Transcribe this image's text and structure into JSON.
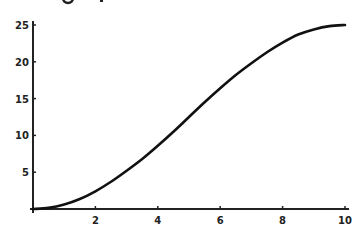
{
  "chart_data": {
    "type": "line",
    "title": "",
    "xlabel": "",
    "ylabel": "",
    "xlim": [
      0,
      10
    ],
    "ylim": [
      0,
      25
    ],
    "grid": false,
    "legend": null,
    "x_ticks": [
      2,
      4,
      6,
      8,
      10
    ],
    "y_ticks": [
      5,
      10,
      15,
      20,
      25
    ],
    "series": [
      {
        "name": "curve",
        "color": "#111111",
        "x": [
          0,
          0.5,
          1,
          1.5,
          2,
          2.5,
          3,
          3.5,
          4,
          4.5,
          5,
          5.5,
          6,
          6.5,
          7,
          7.5,
          8,
          8.5,
          9,
          9.5,
          10
        ],
        "y": [
          0,
          0.15,
          0.6,
          1.35,
          2.4,
          3.7,
          5.2,
          6.8,
          8.6,
          10.5,
          12.5,
          14.5,
          16.4,
          18.2,
          19.8,
          21.3,
          22.6,
          23.7,
          24.4,
          24.85,
          25
        ]
      }
    ]
  },
  "axes": {
    "x_tick_labels": [
      "2",
      "4",
      "6",
      "8",
      "10"
    ],
    "y_tick_labels": [
      "5",
      "10",
      "15",
      "20",
      "25"
    ]
  }
}
